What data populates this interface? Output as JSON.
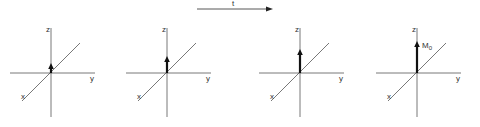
{
  "time_arrow": {
    "label": "t",
    "x1": 197,
    "x2": 272,
    "y": 9
  },
  "axis_labels": {
    "z": "z",
    "y": "y",
    "x": "x"
  },
  "vector_label": {
    "main": "M",
    "sub": "0"
  },
  "panels": [
    {
      "id": 1,
      "origin_x": 51,
      "origin_y": 73,
      "vector_tip_y": 64
    },
    {
      "id": 2,
      "origin_x": 167,
      "origin_y": 73,
      "vector_tip_y": 57
    },
    {
      "id": 3,
      "origin_x": 300,
      "origin_y": 73,
      "vector_tip_y": 50
    },
    {
      "id": 4,
      "origin_x": 417,
      "origin_y": 73,
      "vector_tip_y": 42,
      "labeled": true
    }
  ]
}
